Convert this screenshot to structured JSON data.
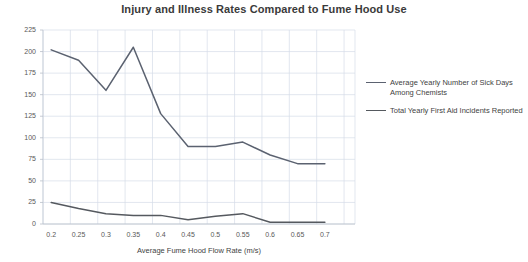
{
  "chart_data": {
    "type": "line",
    "title": "Injury and Illness Rates Compared to Fume Hood Use",
    "xlabel": "Average Fume Hood Flow Rate (m/s)",
    "ylabel": "",
    "x": [
      0.2,
      0.25,
      0.3,
      0.35,
      0.4,
      0.45,
      0.5,
      0.55,
      0.6,
      0.65,
      0.7
    ],
    "xtick_labels": [
      "0.2",
      "0.25",
      "0.3",
      "0.35",
      "0.4",
      "0.45",
      "0.5",
      "0.55",
      "0.6",
      "0.65",
      "0.7"
    ],
    "ytick_labels": [
      "0",
      "25",
      "50",
      "75",
      "100",
      "125",
      "150",
      "175",
      "200",
      "225"
    ],
    "yticks": [
      0,
      25,
      50,
      75,
      100,
      125,
      150,
      175,
      200,
      225
    ],
    "ylim": [
      0,
      225
    ],
    "xlim": [
      0.2,
      0.7
    ],
    "grid": true,
    "legend_position": "right",
    "series": [
      {
        "name": "Average Yearly Number of Sick Days Among Chemists",
        "color": "#5b6270",
        "values": [
          202,
          190,
          155,
          205,
          128,
          90,
          90,
          95,
          80,
          70,
          70
        ]
      },
      {
        "name": "Total Yearly First Aid Incidents Reported",
        "color": "#55595f",
        "values": [
          25,
          18,
          12,
          10,
          10,
          5,
          9,
          12,
          2,
          2,
          2
        ]
      }
    ]
  }
}
